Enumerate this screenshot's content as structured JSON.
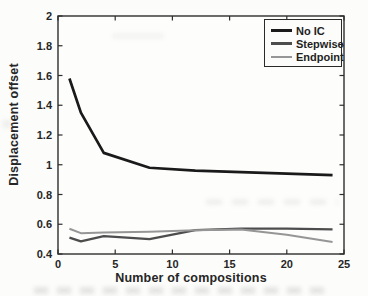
{
  "figure": {
    "background": "#fcfcfa",
    "axis_color": "#2e2e2e",
    "tick_label_color": "#262626",
    "legend_border_color": "#2a2a2a"
  },
  "chart_data": {
    "type": "line",
    "title": "",
    "xlabel": "Number of compositions",
    "ylabel": "Displacement offset",
    "xlim": [
      0,
      25
    ],
    "ylim": [
      0.4,
      2
    ],
    "xticks": [
      0,
      5,
      10,
      15,
      20,
      25
    ],
    "yticks": [
      0.4,
      0.6,
      0.8,
      1,
      1.2,
      1.4,
      1.6,
      1.8,
      2
    ],
    "grid": false,
    "legend_position": "top-right",
    "x": [
      1,
      2,
      4,
      8,
      12,
      16,
      20,
      24
    ],
    "series": [
      {
        "name": "No IC",
        "color": "#1a1a1a",
        "line_width": 2.7,
        "values": [
          1.58,
          1.35,
          1.08,
          0.98,
          0.96,
          0.95,
          0.94,
          0.93
        ]
      },
      {
        "name": "Stepwise",
        "color": "#4d4d4d",
        "line_width": 2.3,
        "values": [
          0.51,
          0.485,
          0.52,
          0.5,
          0.56,
          0.57,
          0.57,
          0.565
        ]
      },
      {
        "name": "Endpoint",
        "color": "#969696",
        "line_width": 2.0,
        "values": [
          0.57,
          0.54,
          0.545,
          0.55,
          0.56,
          0.565,
          0.53,
          0.48
        ]
      }
    ]
  }
}
